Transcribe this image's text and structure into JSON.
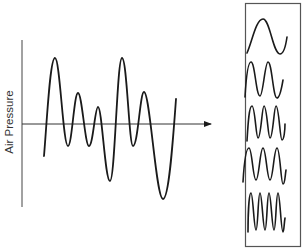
{
  "diagram": {
    "y_axis_label": "Air Pressure",
    "colors": {
      "background": "#ffffff",
      "stroke": "#1a1a1a",
      "axis": "#444444",
      "box_border": "#555555",
      "text": "#333333"
    },
    "composite_wave": {
      "description": "Complex waveform (sum of components)",
      "points": [
        [
          44,
          156
        ],
        [
          55,
          58
        ],
        [
          68,
          146
        ],
        [
          78,
          93
        ],
        [
          89,
          146
        ],
        [
          98,
          107
        ],
        [
          110,
          181
        ],
        [
          122,
          58
        ],
        [
          133,
          146
        ],
        [
          144,
          92
        ],
        [
          163,
          199
        ],
        [
          176,
          99
        ]
      ]
    },
    "arrow": {
      "from": [
        22,
        124
      ],
      "to": [
        211,
        124
      ],
      "meaning": "decomposes into"
    },
    "components": [
      {
        "label": "component-1",
        "cycles": 1
      },
      {
        "label": "component-2",
        "cycles": 2
      },
      {
        "label": "component-3",
        "cycles": 3
      },
      {
        "label": "component-4",
        "cycles": 3
      },
      {
        "label": "component-5",
        "cycles": 4
      }
    ]
  }
}
